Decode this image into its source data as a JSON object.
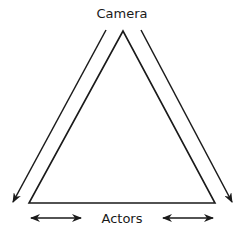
{
  "diagram": {
    "top_label": "Camera",
    "bottom_label": "Actors",
    "shapes": {
      "triangle": "camera-actors-triangle",
      "left_arrow": "camera-to-left-arrow",
      "right_arrow": "camera-to-right-arrow",
      "bottom_left_arrow": "double-headed-arrow",
      "bottom_right_arrow": "double-headed-arrow"
    },
    "colors": {
      "stroke": "#1a1a1a",
      "background": "#ffffff"
    }
  }
}
